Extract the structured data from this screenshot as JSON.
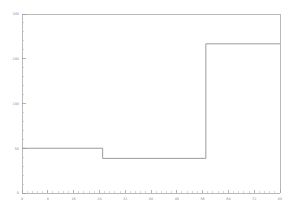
{
  "chart_data": {
    "type": "line",
    "subtype": "step",
    "title": "",
    "subtitle": "",
    "xlabel": "",
    "ylabel": "",
    "xlim": [
      0,
      80
    ],
    "ylim": [
      0,
      300
    ],
    "grid": false,
    "legend": null,
    "legend_position": "none",
    "x_ticks": [
      0,
      8,
      16,
      24,
      32,
      40,
      48,
      56,
      64,
      72,
      80
    ],
    "x_tick_labels": [
      "0",
      "8",
      "16",
      "24",
      "32",
      "40",
      "48",
      "56",
      "64",
      "72",
      "80"
    ],
    "x_minor_tick_count": 4,
    "y_ticks": [
      0,
      50,
      100,
      200,
      300
    ],
    "y_tick_labels": [
      "0",
      "50",
      "100",
      "200",
      "300"
    ],
    "y_minor_tick_count": 20,
    "series": [
      {
        "name": "step",
        "color": "#9a9a9a",
        "x": [
          0,
          25,
          25,
          57,
          57,
          80
        ],
        "y": [
          75,
          75,
          58,
          58,
          250,
          250
        ],
        "steps": [
          {
            "x_start": 0,
            "x_end": 25,
            "value": 75
          },
          {
            "x_start": 25,
            "x_end": 57,
            "value": 58
          },
          {
            "x_start": 57,
            "x_end": 80,
            "value": 250
          }
        ]
      }
    ],
    "annotations": []
  },
  "figure": {
    "background_color": "#ffffff",
    "axis_color": "#a8a8a8",
    "tick_label_color": "#8c8c8c",
    "line_color": "#9a9a9a"
  }
}
